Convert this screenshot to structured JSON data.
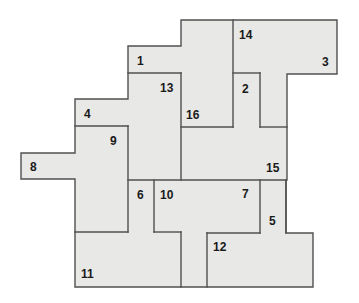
{
  "diagram": {
    "type": "floor-plan-partition",
    "fill_color": "#e8e8e6",
    "stroke_color": "#505050",
    "label_color": "#1a1a1a",
    "outline": [
      [
        181,
        20
      ],
      [
        337,
        20
      ],
      [
        337,
        74
      ],
      [
        287,
        74
      ],
      [
        287,
        180
      ],
      [
        286,
        180
      ],
      [
        286,
        233
      ],
      [
        313,
        233
      ],
      [
        313,
        287
      ],
      [
        75,
        287
      ],
      [
        75,
        179
      ],
      [
        21,
        179
      ],
      [
        21,
        153
      ],
      [
        75,
        153
      ],
      [
        75,
        99
      ],
      [
        128,
        99
      ],
      [
        128,
        46
      ],
      [
        181,
        46
      ]
    ],
    "edges": [
      [
        [
          128,
          73
        ],
        [
          181,
          73
        ]
      ],
      [
        [
          181,
          73
        ],
        [
          181,
          180
        ]
      ],
      [
        [
          233,
          20
        ],
        [
          233,
          127
        ]
      ],
      [
        [
          181,
          127
        ],
        [
          233,
          127
        ]
      ],
      [
        [
          233,
          73
        ],
        [
          260,
          73
        ]
      ],
      [
        [
          260,
          73
        ],
        [
          260,
          127
        ]
      ],
      [
        [
          260,
          127
        ],
        [
          287,
          127
        ]
      ],
      [
        [
          75,
          126
        ],
        [
          128,
          126
        ]
      ],
      [
        [
          128,
          126
        ],
        [
          128,
          232
        ]
      ],
      [
        [
          75,
          232
        ],
        [
          128,
          232
        ]
      ],
      [
        [
          128,
          180
        ],
        [
          286,
          180
        ]
      ],
      [
        [
          154,
          180
        ],
        [
          154,
          232
        ]
      ],
      [
        [
          154,
          232
        ],
        [
          181,
          232
        ]
      ],
      [
        [
          181,
          232
        ],
        [
          181,
          287
        ]
      ],
      [
        [
          260,
          180
        ],
        [
          260,
          233
        ]
      ],
      [
        [
          207,
          233
        ],
        [
          260,
          233
        ]
      ],
      [
        [
          207,
          233
        ],
        [
          207,
          287
        ]
      ],
      [
        [
          286,
          180
        ],
        [
          286,
          233
        ]
      ]
    ],
    "labels": [
      {
        "id": "1",
        "x": 137,
        "y": 65
      },
      {
        "id": "2",
        "x": 242,
        "y": 93
      },
      {
        "id": "3",
        "x": 322,
        "y": 66
      },
      {
        "id": "4",
        "x": 84,
        "y": 118
      },
      {
        "id": "5",
        "x": 269,
        "y": 225
      },
      {
        "id": "6",
        "x": 137,
        "y": 199
      },
      {
        "id": "7",
        "x": 242,
        "y": 198
      },
      {
        "id": "8",
        "x": 30,
        "y": 171
      },
      {
        "id": "9",
        "x": 110,
        "y": 145
      },
      {
        "id": "10",
        "x": 160,
        "y": 199
      },
      {
        "id": "11",
        "x": 81,
        "y": 278
      },
      {
        "id": "12",
        "x": 213,
        "y": 251
      },
      {
        "id": "13",
        "x": 160,
        "y": 92
      },
      {
        "id": "14",
        "x": 239,
        "y": 39
      },
      {
        "id": "15",
        "x": 266,
        "y": 172
      },
      {
        "id": "16",
        "x": 186,
        "y": 119
      }
    ]
  }
}
